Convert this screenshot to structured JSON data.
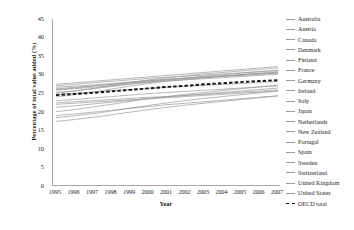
{
  "chart_data": {
    "type": "line",
    "title": "",
    "xlabel": "Year",
    "ylabel": "Percentage of total value added (%)",
    "x": [
      1995,
      1996,
      1997,
      1998,
      1999,
      2000,
      2001,
      2002,
      2003,
      2004,
      2005,
      2006,
      2007
    ],
    "xticklabels": [
      "1995",
      "1996",
      "1997",
      "1998",
      "1999",
      "2000",
      "2001",
      "2002",
      "2003",
      "2004",
      "2005",
      "2006",
      "2007"
    ],
    "yticklabels": [
      "45",
      "40",
      "35",
      "30",
      "25",
      "20",
      "15",
      "10",
      "5",
      "0"
    ],
    "ylim": [
      0,
      45
    ],
    "ytick_step": 5,
    "grid": false,
    "legend_position": "right",
    "series": [
      {
        "name": "Australia",
        "style": "solid",
        "color": "#9a9a9a",
        "values": [
          26.0,
          26.4,
          26.9,
          27.4,
          27.8,
          28.1,
          28.5,
          28.9,
          29.2,
          29.5,
          29.8,
          30.1,
          30.4
        ]
      },
      {
        "name": "Austria",
        "style": "solid",
        "color": "#9a9a9a",
        "values": [
          22.4,
          22.7,
          23.0,
          23.3,
          23.6,
          23.9,
          24.1,
          24.4,
          24.7,
          25.0,
          25.3,
          25.6,
          25.9
        ]
      },
      {
        "name": "Canada",
        "style": "solid",
        "color": "#9a9a9a",
        "values": [
          24.6,
          25.0,
          25.3,
          25.7,
          26.0,
          26.3,
          26.6,
          26.9,
          27.1,
          27.4,
          27.6,
          27.9,
          28.2
        ]
      },
      {
        "name": "Denmark",
        "style": "solid",
        "color": "#9a9a9a",
        "values": [
          25.2,
          25.6,
          26.2,
          26.8,
          27.4,
          28.0,
          28.6,
          29.1,
          29.6,
          30.0,
          30.4,
          30.8,
          31.2
        ]
      },
      {
        "name": "Finland",
        "style": "solid",
        "color": "#9a9a9a",
        "values": [
          20.0,
          20.6,
          21.3,
          22.0,
          22.8,
          23.5,
          24.1,
          24.7,
          25.2,
          25.7,
          26.2,
          26.7,
          27.2
        ]
      },
      {
        "name": "France",
        "style": "solid",
        "color": "#9a9a9a",
        "values": [
          26.6,
          26.9,
          27.2,
          27.6,
          28.0,
          28.4,
          28.8,
          29.1,
          29.4,
          29.7,
          30.0,
          30.3,
          30.6
        ]
      },
      {
        "name": "Germany",
        "style": "solid",
        "color": "#9a9a9a",
        "values": [
          26.2,
          26.6,
          27.0,
          27.4,
          27.9,
          28.3,
          28.7,
          29.0,
          29.3,
          29.6,
          29.9,
          30.2,
          30.5
        ]
      },
      {
        "name": "Ireland",
        "style": "solid",
        "color": "#9a9a9a",
        "values": [
          18.4,
          18.9,
          19.5,
          20.2,
          21.0,
          21.7,
          22.4,
          23.0,
          23.6,
          24.1,
          24.6,
          25.1,
          25.6
        ]
      },
      {
        "name": "Italy",
        "style": "solid",
        "color": "#9a9a9a",
        "values": [
          22.0,
          22.3,
          22.6,
          22.9,
          23.2,
          23.5,
          23.8,
          24.1,
          24.4,
          24.7,
          25.0,
          25.3,
          25.6
        ]
      },
      {
        "name": "Japan",
        "style": "solid",
        "color": "#9a9a9a",
        "values": [
          23.0,
          23.3,
          23.7,
          24.1,
          24.5,
          24.9,
          25.2,
          25.5,
          25.8,
          26.1,
          26.4,
          26.7,
          27.0
        ]
      },
      {
        "name": "Netherlands",
        "style": "solid",
        "color": "#9a9a9a",
        "values": [
          25.8,
          26.2,
          26.6,
          27.0,
          27.5,
          27.9,
          28.3,
          28.6,
          28.9,
          29.2,
          29.5,
          29.8,
          30.1
        ]
      },
      {
        "name": "New Zealand",
        "style": "solid",
        "color": "#9a9a9a",
        "values": [
          21.2,
          21.6,
          22.1,
          22.6,
          23.1,
          23.6,
          24.0,
          24.4,
          24.8,
          25.2,
          25.6,
          26.0,
          26.4
        ]
      },
      {
        "name": "Portugal",
        "style": "solid",
        "color": "#9a9a9a",
        "values": [
          17.4,
          17.9,
          18.5,
          19.2,
          19.9,
          20.6,
          21.2,
          21.8,
          22.3,
          22.8,
          23.3,
          23.8,
          24.3
        ]
      },
      {
        "name": "Spain",
        "style": "solid",
        "color": "#9a9a9a",
        "values": [
          19.0,
          19.4,
          19.9,
          20.4,
          20.9,
          21.4,
          21.9,
          22.3,
          22.7,
          23.1,
          23.5,
          23.9,
          24.3
        ]
      },
      {
        "name": "Sweden",
        "style": "solid",
        "color": "#9a9a9a",
        "values": [
          24.0,
          24.6,
          25.3,
          26.1,
          26.9,
          27.6,
          28.2,
          28.7,
          29.2,
          29.6,
          30.0,
          30.4,
          30.8
        ]
      },
      {
        "name": "Switzerland",
        "style": "solid",
        "color": "#9a9a9a",
        "values": [
          27.4,
          27.8,
          28.2,
          28.6,
          29.0,
          29.4,
          29.8,
          30.2,
          30.6,
          31.0,
          31.4,
          31.8,
          32.2
        ]
      },
      {
        "name": "United Kingdom",
        "style": "solid",
        "color": "#9a9a9a",
        "values": [
          25.0,
          25.6,
          26.3,
          27.1,
          27.9,
          28.6,
          29.2,
          29.7,
          30.2,
          30.6,
          31.0,
          31.4,
          31.8
        ]
      },
      {
        "name": "United States",
        "style": "solid",
        "color": "#9a9a9a",
        "values": [
          27.0,
          27.4,
          27.8,
          28.2,
          28.6,
          29.0,
          29.3,
          29.6,
          29.9,
          30.2,
          30.5,
          30.8,
          31.1
        ]
      },
      {
        "name": "OECD total",
        "style": "dashed",
        "color": "#111111",
        "values": [
          24.5,
          24.8,
          25.1,
          25.5,
          25.9,
          26.3,
          26.7,
          27.0,
          27.4,
          27.7,
          28.0,
          28.3,
          28.5
        ]
      }
    ]
  },
  "legend": {
    "items": [
      {
        "label": "Australia"
      },
      {
        "label": "Austria"
      },
      {
        "label": "Canada"
      },
      {
        "label": "Denmark"
      },
      {
        "label": "Finland"
      },
      {
        "label": "France"
      },
      {
        "label": "Germany"
      },
      {
        "label": "Ireland"
      },
      {
        "label": "Italy"
      },
      {
        "label": "Japan"
      },
      {
        "label": "Netherlands"
      },
      {
        "label": "New Zealand"
      },
      {
        "label": "Portugal"
      },
      {
        "label": "Spain"
      },
      {
        "label": "Sweden"
      },
      {
        "label": "Switzerland"
      },
      {
        "label": "United Kingdom"
      },
      {
        "label": "United States"
      },
      {
        "label": "OECD total"
      }
    ]
  }
}
